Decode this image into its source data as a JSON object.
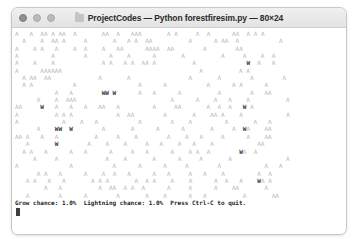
{
  "window": {
    "title": "ProjectCodes — Python forestfiresim.py — 80×24",
    "folder_icon": "folder-icon",
    "traffic_lights": [
      {
        "name": "close",
        "label": "Close"
      },
      {
        "name": "minimize",
        "label": "Minimize"
      },
      {
        "name": "zoom",
        "label": "Zoom"
      }
    ]
  },
  "terminal": {
    "columns": 80,
    "rows": 24,
    "tree_glyph": "A",
    "fire_glyph": "W",
    "empty_glyph": " ",
    "colors": {
      "tree": "#b6b6b6",
      "fire": "#3a3a3a",
      "background": "#ffffff",
      "status_text": "#1d1d1d"
    },
    "grid": [
      "A   A  AA A AA  A       AA  A   AAA       A A     A  A      AA  A A A       ",
      "  A    A  AA A     A       A   A A  AA          A      A AA  A           A  ",
      "A    A A   A    A  A    A   AA      AAAA  AA        A        AA             ",
      "A         A        A      A    A      A       A          A     A    A  A    ",
      "A    A    A             A A   A A  AA A          A              W  A   A    ",
      "A      AAAAAA                                      A          A A           ",
      "  A AA  AA             A       A                A       A        A        A ",
      "  A A           A                 A      A           A      A A      A      ",
      "           A   A        WW W      A   A      A          A        A   AA     ",
      "      A    A  AAA                          A      A    A   A    A          A",
      "AA     W   A   A   A   AA   A         A     AA       A  A  A   W A          ",
      "A          A A A            A  AA        A       A    AA A    A            A",
      "A            A    A   A           A        A    A         A       A   A     ",
      "      A    WW  W        A       A      A      A       A     A  WA    AA     ",
      "AA A   A   A          A     A    A        A    A   A     A      A    AA     ",
      "   A       W        A    A    A     A   A    A   A    A            AA       ",
      "  A A   A      A   A      A     A   A      A    A A  A        WA  A         ",
      "     A     A             A    A       A      A     A       A               A",
      "A              A           A      A      A     A        A            A   A  ",
      "      A A   A      A    A  A   A      A   A     A   A    A         A  A     ",
      "   A A   A   A       A A A       A  A A    A    A      A  A   A    WA A     ",
      "        A   A          A  AA  A A  A      A     A      A    AA       A      ",
      "   A        A      A        A       A    A      A   A          A       AA   "
    ],
    "status": {
      "grow_label": "Grow chance:",
      "grow_value": "1.0%",
      "lightning_label": "Lightning chance:",
      "lightning_value": "1.0%",
      "quit_hint": "Press Ctrl-C to quit.",
      "full_text": "Grow chance: 1.0%  Lightning chance: 1.0%  Press Ctrl-C to quit."
    }
  }
}
